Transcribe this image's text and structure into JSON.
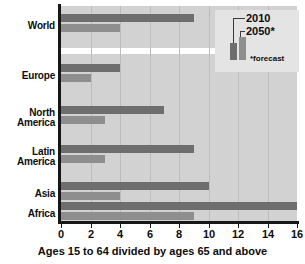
{
  "chart_data": {
    "type": "bar",
    "orientation": "horizontal",
    "title": "",
    "subtitle": "",
    "xlabel": "Ages 15 to 64 divided by ages 65 and above",
    "ylabel": "",
    "xlim": [
      0,
      16
    ],
    "xticks": [
      0,
      2,
      4,
      6,
      8,
      10,
      12,
      14,
      16
    ],
    "xtick_labels": [
      "0",
      "2",
      "4",
      "6",
      "8",
      "10",
      "12",
      "14",
      "16"
    ],
    "grid": true,
    "grid_axis": "x",
    "legend_position": "top-right",
    "categories": [
      "World",
      "Europe",
      "North\nAmerica",
      "Latin\nAmerica",
      "Asia",
      "Africa"
    ],
    "series": [
      {
        "name": "2010",
        "color": "#6e6e6e",
        "values": [
          9,
          4,
          7,
          9,
          10,
          16
        ]
      },
      {
        "name": "2050*",
        "color": "#8e8e8e",
        "values": [
          4,
          2,
          3,
          3,
          4,
          9
        ]
      }
    ],
    "annotations": [
      "*forecast"
    ]
  },
  "axis": {
    "caption": "Ages 15 to 64 divided by ages 65 and above"
  },
  "legend": {
    "label_2010": "2010",
    "label_2050": "2050*",
    "footnote": "*forecast"
  },
  "colors": {
    "plot_background": "#d2d2d2",
    "gridline": "#bcbcbc",
    "axis": "#171717",
    "series_2010": "#6e6e6e",
    "series_2050": "#8e8e8e",
    "legend_background": "#e4e4e4",
    "separator": "#ffffff"
  }
}
